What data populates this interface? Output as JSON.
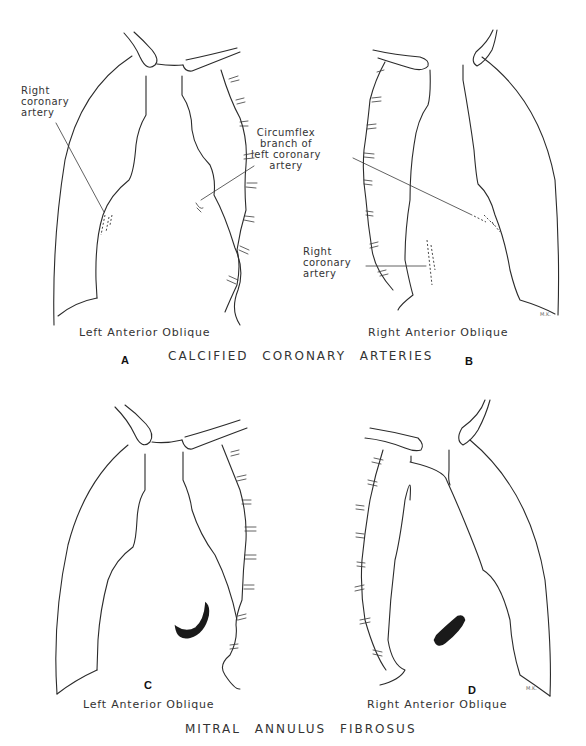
{
  "figure": {
    "top_section": {
      "title": "CALCIFIED CORONARY ARTERIES",
      "panels": [
        {
          "letter": "A",
          "view_label": "Left Anterior Oblique",
          "annotations": [
            "Right coronary artery"
          ]
        },
        {
          "letter": "B",
          "view_label": "Right Anterior Oblique",
          "annotations": [
            "Right coronary artery"
          ]
        }
      ],
      "shared_annotation": "Circumflex branch of left coronary artery"
    },
    "bottom_section": {
      "title": "MITRAL ANNULUS FIBROSUS",
      "panels": [
        {
          "letter": "C",
          "view_label": "Left Anterior Oblique"
        },
        {
          "letter": "D",
          "view_label": "Right Anterior Oblique"
        }
      ]
    },
    "labels": {
      "a_rca_line1": "Right",
      "a_rca_line2": "coronary",
      "a_rca_line3": "artery",
      "circ_line1": "Circumflex",
      "circ_line2": "branch of",
      "circ_line3": "left coronary",
      "circ_line4": "artery",
      "b_rca_line1": "Right",
      "b_rca_line2": "coronary",
      "b_rca_line3": "artery",
      "artist_initials": "M.K."
    }
  }
}
